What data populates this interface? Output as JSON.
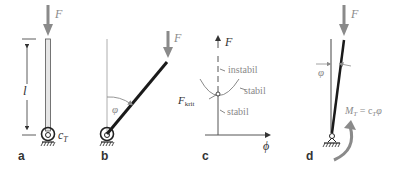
{
  "panels": {
    "a": {
      "label": "a",
      "force": "F",
      "length": "l",
      "spring": "c",
      "spring_sub": "T"
    },
    "b": {
      "label": "b",
      "force": "F",
      "angle": "φ"
    },
    "c": {
      "label": "c",
      "y_axis": "F",
      "x_axis": "ϕ",
      "crit": "F",
      "crit_sub": "krit",
      "region_upper": "instabil",
      "region_curve": "stabil",
      "region_lower": "stabil"
    },
    "d": {
      "label": "d",
      "force": "F",
      "angle": "φ",
      "moment": "M",
      "moment_sub": "T",
      "moment_eq": " = c",
      "moment_eq_sub": "T",
      "moment_eq_end": "φ"
    }
  },
  "colors": {
    "rod": "#1a1a1a",
    "arrow": "#8a8a8a",
    "guide": "#9a9a9a",
    "text_gray": "#8a8a8a"
  }
}
